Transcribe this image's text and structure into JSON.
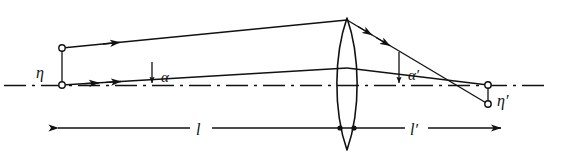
{
  "figure": {
    "type": "optical-ray-diagram",
    "background_color": "#ffffff",
    "ink_color": "#111111",
    "width": 564,
    "height": 159
  },
  "labels": {
    "object_height": "η",
    "image_height": "η′",
    "object_angle": "α",
    "image_angle": "α′",
    "object_distance": "l",
    "image_distance": "l′"
  },
  "elements": {
    "optical_axis": {
      "name": "optical-axis",
      "style": "dash-dot",
      "y": 85,
      "x_start": 4,
      "x_end": 548
    },
    "lens": {
      "name": "biconvex-lens",
      "center_x": 347,
      "top_y": 18,
      "bottom_y": 150,
      "half_width": 14
    },
    "object_points": [
      {
        "name": "object-top-point",
        "x": 62,
        "y": 48,
        "marker": "open-circle"
      },
      {
        "name": "object-axial-point",
        "x": 62,
        "y": 85,
        "marker": "open-circle"
      }
    ],
    "image_points": [
      {
        "name": "image-axial-point",
        "x": 488,
        "y": 85,
        "marker": "open-circle"
      },
      {
        "name": "image-bottom-point",
        "x": 488,
        "y": 104,
        "marker": "open-circle"
      }
    ],
    "object_height_bar": {
      "name": "object-height-bar",
      "x": 62,
      "y_top": 48,
      "y_bottom": 85
    },
    "image_height_bar": {
      "name": "image-height-bar",
      "x": 488,
      "y_top": 85,
      "y_bottom": 104
    },
    "rays": [
      {
        "name": "ray-upper-incident",
        "from": [
          62,
          48
        ],
        "to": [
          347,
          20
        ],
        "arrowheads": 1
      },
      {
        "name": "ray-lower-incident",
        "from": [
          62,
          85
        ],
        "to": [
          347,
          68
        ],
        "arrowheads": 2
      },
      {
        "name": "ray-upper-exit",
        "from": [
          347,
          20
        ],
        "to": [
          488,
          104
        ],
        "arrowheads": 2
      },
      {
        "name": "ray-lower-exit",
        "from": [
          347,
          68
        ],
        "to": [
          488,
          85
        ],
        "arrowheads": 0
      }
    ],
    "angle_markers": [
      {
        "name": "angle-alpha-marker",
        "x": 152,
        "y_top": 62,
        "y_bottom": 86,
        "label_x": 163,
        "label_y": 81
      },
      {
        "name": "angle-alpha-prime-marker",
        "x": 399,
        "y_top": 52,
        "y_bottom": 86,
        "label_x": 408,
        "label_y": 79
      }
    ],
    "dimension_lines": [
      {
        "name": "object-distance-dimension",
        "y": 128,
        "x_start": 57,
        "x_end": 347,
        "arrow_end": "left",
        "label_x": 200,
        "label_y": 136
      },
      {
        "name": "image-distance-dimension",
        "y": 128,
        "x_start": 347,
        "x_end": 502,
        "arrow_end": "right",
        "label_x": 415,
        "label_y": 136
      }
    ]
  }
}
